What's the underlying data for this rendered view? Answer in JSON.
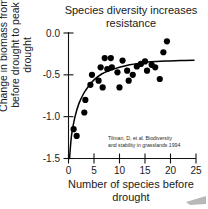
{
  "figure": {
    "title": "Species diversity increases\nresistance",
    "citation": [
      "Tilman, D, et al. Biodiversity",
      "and stability in grasslands 1994"
    ]
  },
  "chart_data": {
    "type": "scatter",
    "title": "Species diversity increases resistance",
    "xlabel": "Number of species before drought",
    "ylabel": "Change in biomass from before drought to peak drought",
    "xlim": [
      0,
      25
    ],
    "ylim": [
      -1.5,
      0.0
    ],
    "xticks": [
      0,
      5,
      10,
      15,
      20,
      25
    ],
    "yticks": [
      0.0,
      -0.5,
      -1.0,
      -1.5
    ],
    "xticklabels": [
      "0",
      "5",
      "10",
      "15",
      "20",
      "25"
    ],
    "yticklabels": [
      "0.0",
      "-0.5",
      "-1.0",
      "-1.5"
    ],
    "grid": false,
    "legend": null,
    "annotation": "Tilman, D, et al. Biodiversity and stability in grasslands 1994",
    "series": [
      {
        "name": "Plots",
        "marker": "filled-circle",
        "color": "#000000",
        "points": [
          {
            "x": 1.0,
            "y": -1.15
          },
          {
            "x": 1.6,
            "y": -1.23
          },
          {
            "x": 3.1,
            "y": -0.95
          },
          {
            "x": 3.3,
            "y": -0.8
          },
          {
            "x": 4.3,
            "y": -0.62
          },
          {
            "x": 4.6,
            "y": -0.5
          },
          {
            "x": 5.9,
            "y": -0.57
          },
          {
            "x": 6.3,
            "y": -0.41
          },
          {
            "x": 6.7,
            "y": -0.65
          },
          {
            "x": 7.1,
            "y": -0.3
          },
          {
            "x": 7.6,
            "y": -0.43
          },
          {
            "x": 8.3,
            "y": -0.3
          },
          {
            "x": 8.5,
            "y": -0.41
          },
          {
            "x": 9.6,
            "y": -0.47
          },
          {
            "x": 10.0,
            "y": -0.65
          },
          {
            "x": 10.6,
            "y": -0.33
          },
          {
            "x": 11.5,
            "y": -0.45
          },
          {
            "x": 11.8,
            "y": -0.57
          },
          {
            "x": 12.6,
            "y": -0.5
          },
          {
            "x": 13.4,
            "y": -0.4
          },
          {
            "x": 14.2,
            "y": -0.37
          },
          {
            "x": 15.0,
            "y": -0.34
          },
          {
            "x": 15.4,
            "y": -0.45
          },
          {
            "x": 16.3,
            "y": -0.38
          },
          {
            "x": 17.0,
            "y": -0.41
          },
          {
            "x": 17.9,
            "y": -0.55
          },
          {
            "x": 18.6,
            "y": -0.23
          },
          {
            "x": 19.3,
            "y": -0.1
          }
        ]
      }
    ],
    "fit": {
      "name": "fitted asymptotic curve",
      "color": "#000000",
      "description": "rises steeply from -1.5 near x=0 and levels off near -0.33",
      "points": [
        {
          "x": 0.2,
          "y": -1.5
        },
        {
          "x": 0.6,
          "y": -1.22
        },
        {
          "x": 1.2,
          "y": -1.02
        },
        {
          "x": 2.0,
          "y": -0.85
        },
        {
          "x": 3.0,
          "y": -0.72
        },
        {
          "x": 4.0,
          "y": -0.63
        },
        {
          "x": 5.0,
          "y": -0.56
        },
        {
          "x": 6.5,
          "y": -0.49
        },
        {
          "x": 8.0,
          "y": -0.45
        },
        {
          "x": 10.0,
          "y": -0.41
        },
        {
          "x": 12.0,
          "y": -0.38
        },
        {
          "x": 14.0,
          "y": -0.36
        },
        {
          "x": 16.0,
          "y": -0.345
        },
        {
          "x": 19.0,
          "y": -0.335
        },
        {
          "x": 22.0,
          "y": -0.33
        },
        {
          "x": 24.6,
          "y": -0.325
        }
      ]
    }
  }
}
